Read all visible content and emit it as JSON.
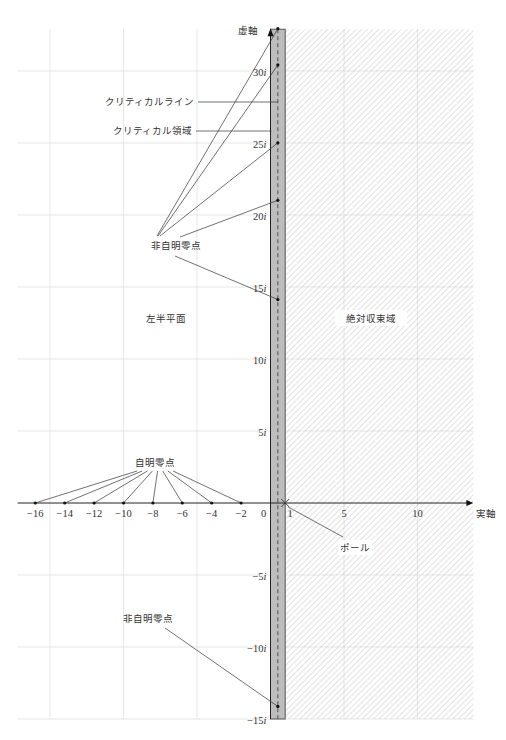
{
  "chart_data": {
    "type": "diagram",
    "title": "",
    "xlabel": "実軸",
    "ylabel": "虚軸",
    "xlim": [
      -17.2,
      13.8
    ],
    "ylim": [
      -15,
      32.9
    ],
    "grid": true,
    "x_ticks": [
      {
        "v": -16,
        "label": "−16"
      },
      {
        "v": -14,
        "label": "−14"
      },
      {
        "v": -12,
        "label": "−12"
      },
      {
        "v": -10,
        "label": "−10"
      },
      {
        "v": -8,
        "label": "−8"
      },
      {
        "v": -6,
        "label": "−6"
      },
      {
        "v": -4,
        "label": "−4"
      },
      {
        "v": -2,
        "label": "−2"
      },
      {
        "v": 0,
        "label": "0"
      },
      {
        "v": 1,
        "label": "1"
      },
      {
        "v": 5,
        "label": "5"
      },
      {
        "v": 10,
        "label": "10"
      }
    ],
    "y_ticks": [
      {
        "v": 30,
        "label": "30i"
      },
      {
        "v": 25,
        "label": "25i"
      },
      {
        "v": 20,
        "label": "20i"
      },
      {
        "v": 15,
        "label": "15i"
      },
      {
        "v": 10,
        "label": "10i"
      },
      {
        "v": 5,
        "label": "5i"
      },
      {
        "v": -5,
        "label": "−5i"
      },
      {
        "v": -10,
        "label": "−10i"
      },
      {
        "v": -15,
        "label": "−15i"
      }
    ],
    "grid_x": [
      -15,
      -10,
      -5,
      5,
      10
    ],
    "grid_y": [
      -15,
      -10,
      -5,
      5,
      10,
      15,
      20,
      25,
      30
    ],
    "critical_strip": {
      "from": 0,
      "to": 1,
      "color": "#bdbdbd"
    },
    "critical_line": 0.5,
    "absolute_convergence_region": {
      "from": 1
    },
    "pole": {
      "re": 1,
      "im": 0
    },
    "trivial_zeros": [
      -2,
      -4,
      -6,
      -8,
      -10,
      -12,
      -14,
      -16
    ],
    "nontrivial_zeros_upper": [
      14.13,
      21.02,
      25.01,
      30.42,
      32.94
    ],
    "nontrivial_zeros_lower": [
      -14.13
    ]
  },
  "labels": {
    "imag_axis": "虚軸",
    "real_axis": "実軸",
    "critical_line": "クリティカルライン",
    "critical_strip": "クリティカル領域",
    "nontrivial_zeros_upper": "非自明零点",
    "left_half_plane": "左半平面",
    "absolute_convergence": "絶対収束域",
    "trivial_zeros": "自明零点",
    "pole": "ポール",
    "nontrivial_zeros_lower": "非自明零点"
  }
}
